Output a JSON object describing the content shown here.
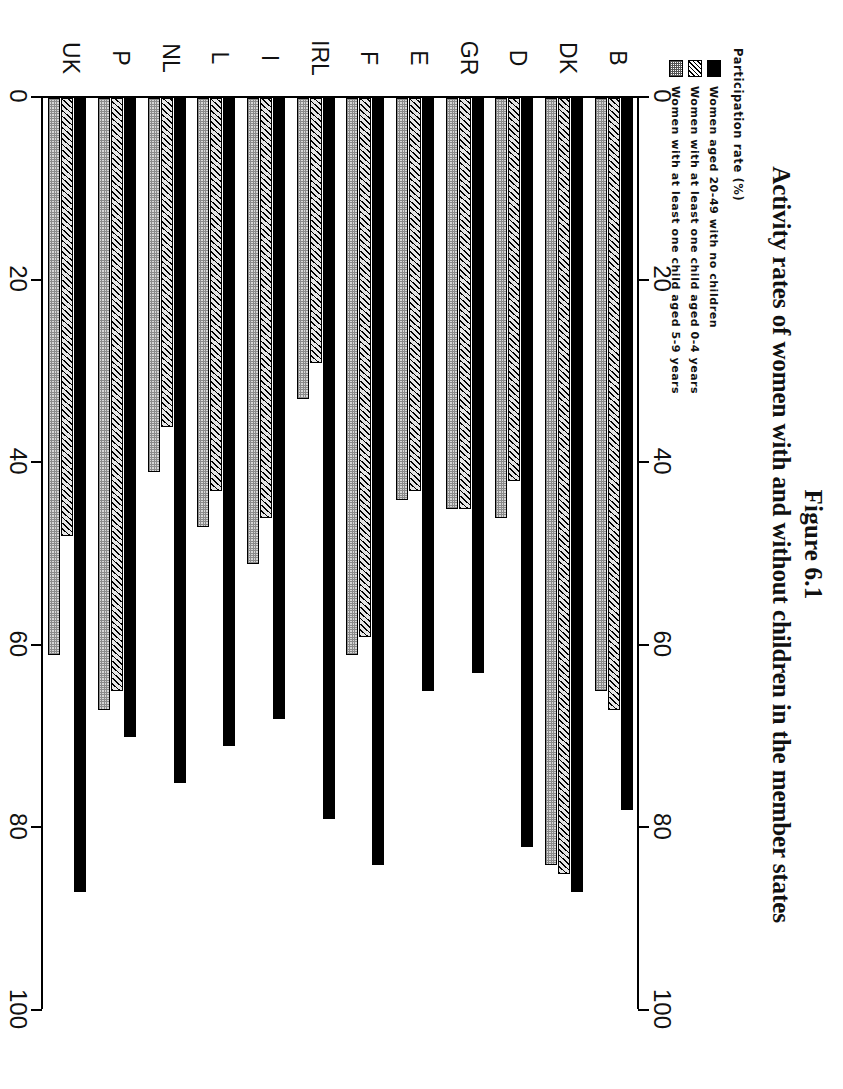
{
  "figure": {
    "number": "Figure 6.1",
    "title": "Activity rates of women with and without children in the member states",
    "axis_caption": "Participation rate (%)"
  },
  "legend": {
    "items": [
      {
        "label": "Women aged 20-49 with no children",
        "pattern": "solid-black",
        "color": "#000000"
      },
      {
        "label": "Women with at least one child aged 0-4 years",
        "pattern": "diagonal-hatch",
        "color": "#d9d9d9"
      },
      {
        "label": "Women with at least one child aged 5-9 years",
        "pattern": "stipple-dot",
        "color": "#d6d6d6"
      }
    ]
  },
  "chart_data": {
    "type": "bar",
    "orientation": "horizontal",
    "title": "Activity rates of women with and without children in the member states",
    "subtitle": "Figure 6.1",
    "xlabel": "Participation rate (%)",
    "ylabel": "",
    "xlim": [
      0,
      100
    ],
    "xticks": [
      0,
      20,
      40,
      60,
      80,
      100
    ],
    "xtick_labels": [
      "0",
      "20",
      "40",
      "60",
      "80",
      "100"
    ],
    "grid": false,
    "legend_position": "top-left",
    "categories": [
      "B",
      "DK",
      "D",
      "GR",
      "E",
      "F",
      "IRL",
      "I",
      "L",
      "NL",
      "P",
      "UK"
    ],
    "series": [
      {
        "name": "Women aged 20-49 with no children",
        "values": [
          78,
          87,
          82,
          63,
          65,
          84,
          79,
          68,
          71,
          75,
          70,
          87
        ]
      },
      {
        "name": "Women with at least one child aged 0-4 years",
        "values": [
          67,
          85,
          42,
          45,
          43,
          59,
          29,
          46,
          43,
          36,
          65,
          48
        ]
      },
      {
        "name": "Women with at least one child aged 5-9 years",
        "values": [
          65,
          84,
          46,
          45,
          44,
          61,
          33,
          51,
          47,
          41,
          67,
          61
        ]
      }
    ]
  }
}
